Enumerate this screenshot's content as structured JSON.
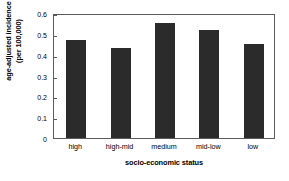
{
  "chart_data": {
    "type": "bar",
    "title": "",
    "xlabel": "socio-economic status",
    "ylabel_line1": "age-adjusted incidence",
    "ylabel_line2": "(per 100,000)",
    "categories": [
      "high",
      "high-mid",
      "medium",
      "mid-low",
      "low"
    ],
    "values": [
      0.47,
      0.43,
      0.55,
      0.52,
      0.45
    ],
    "ylim": [
      0,
      0.6
    ],
    "yticks": [
      0,
      0.1,
      0.2,
      0.3,
      0.4,
      0.5,
      0.6
    ],
    "ytick_labels": [
      "0",
      "0.1",
      "0.2",
      "0.3",
      "0.4",
      "0.5",
      "0.6"
    ],
    "grid": false,
    "legend": false,
    "bar_color": "#2b2b2b",
    "frame_color": "#5b5b5b",
    "background": "#ffffff"
  }
}
